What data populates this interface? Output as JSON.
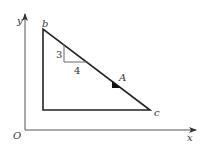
{
  "diagram": {
    "axes": {
      "x_label": "x",
      "y_label": "y",
      "origin_label": "O"
    },
    "triangle": {
      "vertex_top_label": "b",
      "vertex_right_label": "c",
      "point_label": "A"
    },
    "slope_marker": {
      "rise": "3",
      "run": "4"
    },
    "colors": {
      "line": "#222222",
      "thin_line": "#666666",
      "fill": "#111111"
    }
  }
}
